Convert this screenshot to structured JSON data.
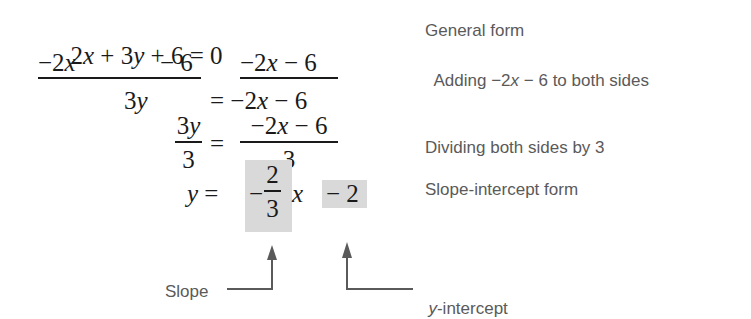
{
  "steps": [
    {
      "equation": {
        "lhs": "2x + 3y + 6",
        "eq": "= 0"
      },
      "description": "General form"
    },
    {
      "equation": {
        "left_term": "−2x",
        "left_const": "− 6",
        "right": "−2x − 6"
      },
      "description_parts": [
        "Adding ",
        "−2",
        "x",
        " − 6 to both sides"
      ]
    },
    {
      "equation": {
        "lhs": "3y",
        "rhs": "= −2x − 6"
      },
      "description": ""
    },
    {
      "equation": {
        "lhs_num": "3y",
        "lhs_den": "3",
        "eq": "=",
        "rhs_num": "−2x − 6",
        "rhs_den": "3"
      },
      "description": "Dividing both sides by 3"
    },
    {
      "equation": {
        "lhs": "y =",
        "slope_sign": "−",
        "slope_num": "2",
        "slope_den": "3",
        "x": "x",
        "intercept": "− 2"
      },
      "description": "Slope-intercept form"
    }
  ],
  "annotations": {
    "slope_label": "Slope",
    "intercept_label_italic": "y",
    "intercept_label_rest": "-intercept"
  },
  "colors": {
    "highlight": "#d9d9d9",
    "math_text": "#1a1a1a",
    "label_text": "#5a5a5a"
  }
}
